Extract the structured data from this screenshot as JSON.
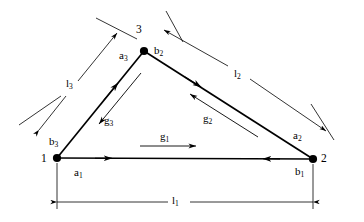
{
  "figure": {
    "type": "geometry-diagram"
  },
  "vertices": [
    {
      "id": "v1",
      "label": "1",
      "x": 57,
      "y": 158
    },
    {
      "id": "v2",
      "label": "2",
      "x": 313,
      "y": 159
    },
    {
      "id": "v3",
      "label": "3",
      "x": 144,
      "y": 51
    }
  ],
  "segment_labels": [
    {
      "id": "a1",
      "base": "a",
      "sub": "1",
      "x": 74,
      "y": 167
    },
    {
      "id": "b1",
      "base": "b",
      "sub": "1",
      "x": 295,
      "y": 166
    },
    {
      "id": "a2",
      "base": "a",
      "sub": "2",
      "x": 293,
      "y": 130
    },
    {
      "id": "b2",
      "base": "b",
      "sub": "2",
      "x": 154,
      "y": 45
    },
    {
      "id": "a3",
      "base": "a",
      "sub": "3",
      "x": 122,
      "y": 50
    },
    {
      "id": "b3",
      "base": "b",
      "sub": "3",
      "x": 50,
      "y": 136
    }
  ],
  "vector_labels": [
    {
      "id": "g1",
      "base": "g",
      "sub": "1",
      "x": 160,
      "y": 131
    },
    {
      "id": "g2",
      "base": "g",
      "sub": "2",
      "x": 203,
      "y": 113
    },
    {
      "id": "g3",
      "base": "g",
      "sub": "3",
      "x": 104,
      "y": 115
    }
  ],
  "dimension_labels": [
    {
      "id": "l1",
      "base": "l",
      "sub": "1",
      "x": 176,
      "y": 196
    },
    {
      "id": "l2",
      "base": "l",
      "sub": "2",
      "x": 237,
      "y": 70
    },
    {
      "id": "l3",
      "base": "l",
      "sub": "3",
      "x": 69,
      "y": 79
    }
  ],
  "colors": {
    "stroke": "#000000",
    "thin_stroke": "#000000",
    "background": "#ffffff"
  }
}
